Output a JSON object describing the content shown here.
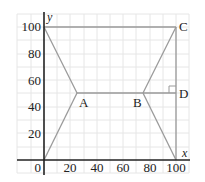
{
  "diagram": {
    "axes": {
      "x_label": "x",
      "y_label": "y",
      "origin_label": "0",
      "x_ticks": [
        "20",
        "40",
        "60",
        "80",
        "100"
      ],
      "y_ticks": [
        "20",
        "40",
        "60",
        "80",
        "100"
      ]
    },
    "points": {
      "A": {
        "label": "A",
        "x": 25,
        "y": 50
      },
      "B": {
        "label": "B",
        "x": 75,
        "y": 50
      },
      "C": {
        "label": "C",
        "x": 100,
        "y": 100
      },
      "D": {
        "label": "D",
        "x": 100,
        "y": 50
      }
    },
    "segments": [
      [
        "(0,0)",
        "A"
      ],
      [
        "(0,100)",
        "A"
      ],
      [
        "A",
        "B"
      ],
      [
        "B",
        "C"
      ],
      [
        "B",
        "(100,0)"
      ],
      [
        "(0,100)",
        "C"
      ],
      [
        "C",
        "(100,0)"
      ]
    ],
    "right_angle_marker_at": "D",
    "colors": {
      "grid": "#e3e3e3",
      "axis": "#222222",
      "lines": "#9a9a9a",
      "text": "#222222"
    }
  }
}
